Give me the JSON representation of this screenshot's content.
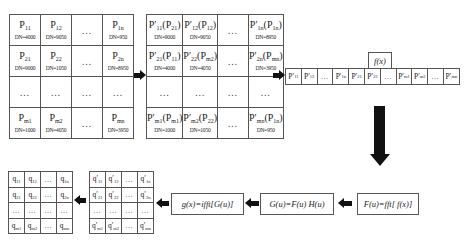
{
  "grid_p": {
    "rows": [
      [
        {
          "label": "P11",
          "dn": "DN=4000"
        },
        {
          "label": "P12",
          "dn": "DN=9050"
        },
        {
          "label": "…",
          "dn": ""
        },
        {
          "label": "P1n",
          "dn": "DN=950"
        }
      ],
      [
        {
          "label": "P21",
          "dn": "DN=9000"
        },
        {
          "label": "P22",
          "dn": "DN=1050"
        },
        {
          "label": "…",
          "dn": ""
        },
        {
          "label": "P2n",
          "dn": "DN=8950"
        }
      ],
      [
        {
          "label": "…",
          "dn": ""
        },
        {
          "label": "…",
          "dn": ""
        },
        {
          "label": "…",
          "dn": ""
        },
        {
          "label": "…",
          "dn": ""
        }
      ],
      [
        {
          "label": "Pm1",
          "dn": "DN=1000"
        },
        {
          "label": "Pm2",
          "dn": "DN=4050"
        },
        {
          "label": "…",
          "dn": ""
        },
        {
          "label": "Pmn",
          "dn": "DN=3950"
        }
      ]
    ]
  },
  "grid_p_prime": {
    "rows": [
      [
        {
          "label": "P′11(P21)",
          "dn": "DN=9000"
        },
        {
          "label": "P′12(P12)",
          "dn": "DN=9050"
        },
        {
          "label": "…",
          "dn": ""
        },
        {
          "label": "P′1n(P1n)",
          "dn": "DN=8950"
        }
      ],
      [
        {
          "label": "P′21(P11)",
          "dn": "DN=4000"
        },
        {
          "label": "P′22(Pm2)",
          "dn": "DN=4050"
        },
        {
          "label": "…",
          "dn": ""
        },
        {
          "label": "P′2n(Pmn)",
          "dn": "DN=3950"
        }
      ],
      [
        {
          "label": "…",
          "dn": ""
        },
        {
          "label": "…",
          "dn": ""
        },
        {
          "label": "…",
          "dn": ""
        },
        {
          "label": "…",
          "dn": ""
        }
      ],
      [
        {
          "label": "P′m1(Pm1)",
          "dn": "DN=1000"
        },
        {
          "label": "P′m2(P22)",
          "dn": "DN=1050"
        },
        {
          "label": "…",
          "dn": ""
        },
        {
          "label": "P′mn(P1n)",
          "dn": "DN=950"
        }
      ]
    ]
  },
  "sequence": {
    "cells": [
      "P′11",
      "P′12",
      "…",
      "P′1n",
      "P′21",
      "P′22",
      "…",
      "P′m1",
      "P′m2",
      "…",
      "P′mn"
    ],
    "fx_label": "f(x)"
  },
  "formulas": {
    "fft": "F(u)=fft[ f(x)]",
    "filter": "G(u)=F(u) H(u)",
    "ifft": "g(x)=ifft[G(u)]"
  },
  "grid_q_prime": {
    "rows": [
      [
        "q′11",
        "q′12",
        "…",
        "q′1n"
      ],
      [
        "q′21",
        "q′22",
        "…",
        "q′2n"
      ],
      [
        "…",
        "…",
        "…",
        "…"
      ],
      [
        "q′m1",
        "q′m2",
        "…",
        "q′mn"
      ]
    ]
  },
  "grid_q": {
    "rows": [
      [
        "q11",
        "q12",
        "…",
        "q1n"
      ],
      [
        "q21",
        "q22",
        "…",
        "q2n"
      ],
      [
        "…",
        "…",
        "…",
        "…"
      ],
      [
        "qm1",
        "qm2",
        "…",
        "qmn"
      ]
    ]
  }
}
